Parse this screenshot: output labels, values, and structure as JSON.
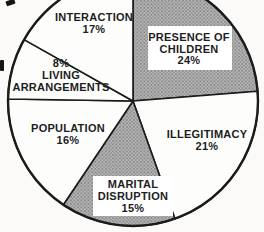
{
  "chart_data": {
    "type": "pie",
    "title": "",
    "direction": "clockwise",
    "start_angle_deg": 0,
    "legend": "none",
    "geometry": {
      "cx": 133,
      "cy": 101,
      "r": 125
    },
    "colors": {
      "background": "#fbfaf8",
      "slice_fill": "#fdfdfc",
      "shaded_base": "#b7b7b7",
      "shaded_dot_dark": "#777777",
      "shaded_dot_mid": "#8a8a8a",
      "outline": "#1b1b1b",
      "label_box": "#ffffff",
      "text": "#1e1e1e"
    },
    "categories": [
      "PRESENCE OF CHILDREN",
      "ILLEGITIMACY",
      "MARITAL DISRUPTION",
      "POPULATION",
      "LIVING ARRANGEMENTS",
      "INTERACTION"
    ],
    "values": [
      24,
      21,
      15,
      16,
      8,
      17
    ],
    "slices": [
      {
        "label": "PRESENCE OF CHILDREN",
        "pct_label": "24%",
        "value": 24,
        "shaded": true,
        "label_lines": [
          "PRESENCE OF",
          "CHILDREN",
          "24%"
        ],
        "label_x": 189,
        "line_ys": [
          41,
          53,
          64
        ],
        "box": {
          "x": 148,
          "y": 26,
          "w": 84,
          "h": 44
        }
      },
      {
        "label": "ILLEGITIMACY",
        "pct_label": "21%",
        "value": 21,
        "shaded": false,
        "label_lines": [
          "ILLEGITIMACY",
          "21%"
        ],
        "label_x": 207,
        "line_ys": [
          138,
          150
        ],
        "box": null
      },
      {
        "label": "MARITAL DISRUPTION",
        "pct_label": "15%",
        "value": 15,
        "shaded": true,
        "label_lines": [
          "MARITAL",
          "DISRUPTION",
          "15%"
        ],
        "label_x": 133,
        "line_ys": [
          188,
          200,
          212
        ],
        "box": {
          "x": 93,
          "y": 176,
          "w": 80,
          "h": 40
        }
      },
      {
        "label": "POPULATION",
        "pct_label": "16%",
        "value": 16,
        "shaded": false,
        "label_lines": [
          "POPULATION",
          "16%"
        ],
        "label_x": 68,
        "line_ys": [
          132,
          144
        ],
        "box": null
      },
      {
        "label": "LIVING ARRANGEMENTS",
        "pct_label": "8%",
        "value": 8,
        "shaded": false,
        "label_lines": [
          "8%",
          "LIVING",
          "ARRANGEMENTS"
        ],
        "label_x": 61,
        "line_ys": [
          67,
          79,
          91
        ],
        "box": null
      },
      {
        "label": "INTERACTION",
        "pct_label": "17%",
        "value": 17,
        "shaded": false,
        "label_lines": [
          "INTERACTION",
          "17%"
        ],
        "label_x": 94,
        "line_ys": [
          21,
          33
        ],
        "box": null
      }
    ]
  }
}
